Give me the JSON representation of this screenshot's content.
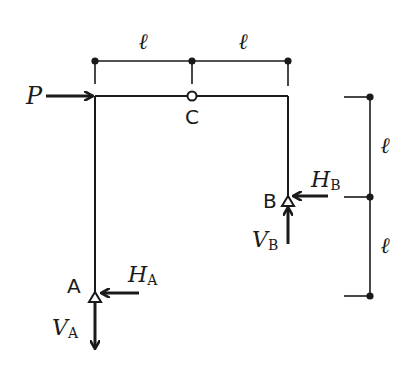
{
  "diagram": {
    "type": "three-hinged frame",
    "colors": {
      "stroke": "#1a1a1a",
      "background": "#ffffff",
      "hinge_fill": "#ffffff"
    },
    "load": {
      "symbol": "P",
      "direction": "right"
    },
    "hinge": {
      "label": "C"
    },
    "supports": {
      "A": {
        "label": "A",
        "horizontal_reaction": "H",
        "horizontal_sub": "A",
        "vertical_reaction": "V",
        "vertical_sub": "A"
      },
      "B": {
        "label": "B",
        "horizontal_reaction": "H",
        "horizontal_sub": "B",
        "vertical_reaction": "V",
        "vertical_sub": "B"
      }
    },
    "dimensions": {
      "top": [
        "ℓ",
        "ℓ"
      ],
      "right": [
        "ℓ",
        "ℓ"
      ]
    }
  }
}
